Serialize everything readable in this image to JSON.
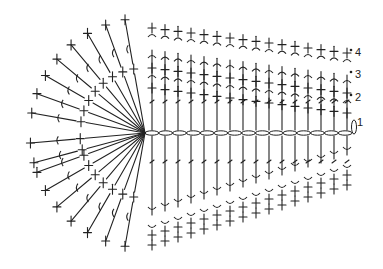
{
  "diagram": {
    "stroke_color": "#222222",
    "chain": {
      "x1": 145,
      "x2": 352,
      "y": 133,
      "count": 15
    },
    "fan_center": {
      "x": 145,
      "y": 133
    },
    "row_labels": [
      {
        "text": "1",
        "x": 357,
        "y": 122
      },
      {
        "text": "2",
        "x": 355,
        "y": 97
      },
      {
        "text": "3",
        "x": 355,
        "y": 74
      },
      {
        "text": "4",
        "x": 355,
        "y": 52
      }
    ],
    "top_columns_x": [
      152,
      165,
      178,
      191,
      204,
      217,
      230,
      243,
      256,
      269,
      282,
      295,
      308,
      321,
      334,
      347
    ],
    "fan_angles_deg": [
      200,
      195,
      185,
      170,
      160,
      150,
      140,
      130,
      120,
      110,
      100,
      240,
      230,
      220,
      210,
      250,
      260
    ]
  }
}
